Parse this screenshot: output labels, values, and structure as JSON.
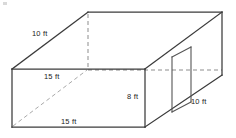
{
  "figure": {
    "shape": "rectangular-prism",
    "background_color": "#ffffff",
    "edge_color": "#3b3b3b",
    "hidden_edge_color": "#8d8d8d",
    "label_color": "#1c1c1c"
  },
  "labels": {
    "depth_top_left": "10 ft",
    "width_upper": "15 ft",
    "height_front": "8 ft",
    "depth_lower_right": "10 ft",
    "width_lower": "15 ft"
  },
  "dimensions": {
    "width": "15 ft",
    "depth": "10 ft",
    "height": "8 ft",
    "door_height": "10 ft"
  },
  "geometry": {
    "front_top_left": [
      12,
      69
    ],
    "front_top_right": [
      145,
      69
    ],
    "front_bottom_right": [
      145,
      127
    ],
    "front_bottom_left": [
      12,
      127
    ],
    "back_top_left": [
      88,
      12
    ],
    "back_top_right": [
      222,
      12
    ],
    "back_bottom_right": [
      222,
      75
    ],
    "door_top_left": [
      172,
      57
    ],
    "door_top_right": [
      191,
      47
    ],
    "door_bottom_right": [
      191,
      102
    ],
    "door_bottom_left": [
      172,
      112
    ]
  }
}
